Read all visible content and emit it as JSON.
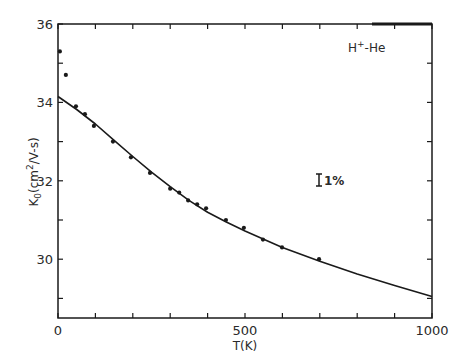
{
  "chart_data": {
    "type": "scatter",
    "title": "",
    "xlabel": "T(K)",
    "ylabel": "K₀(cm²/V-s)",
    "ylabel_parts": {
      "main": "K",
      "sub": "0",
      "rest": "(cm",
      "sup": "2",
      "tail": "/V-s)"
    },
    "xlim": [
      0,
      1000
    ],
    "ylim": [
      28.5,
      36
    ],
    "x_ticks": [
      0,
      100,
      200,
      300,
      400,
      500,
      600,
      700,
      800,
      900,
      1000
    ],
    "x_tick_labels": [
      {
        "value": 0,
        "label": "0"
      },
      {
        "value": 500,
        "label": "500"
      },
      {
        "value": 1000,
        "label": "1000"
      }
    ],
    "y_ticks": [
      29,
      30,
      31,
      32,
      33,
      34,
      35,
      36
    ],
    "y_tick_labels": [
      {
        "value": 30,
        "label": "30"
      },
      {
        "value": 32,
        "label": "32"
      },
      {
        "value": 34,
        "label": "34"
      },
      {
        "value": 36,
        "label": "36"
      }
    ],
    "grid": false,
    "legend": null,
    "series": [
      {
        "name": "measured",
        "kind": "scatter",
        "color": "#1a1a1a",
        "x": [
          5,
          21,
          48,
          72,
          96,
          147,
          195,
          246,
          300,
          324,
          348,
          372,
          396,
          449,
          497,
          548,
          599,
          698
        ],
        "y": [
          35.3,
          34.7,
          33.9,
          33.7,
          33.4,
          33.0,
          32.6,
          32.2,
          31.8,
          31.7,
          31.5,
          31.4,
          31.3,
          31.0,
          30.8,
          30.5,
          30.3,
          30.0
        ]
      },
      {
        "name": "theory",
        "kind": "line",
        "color": "#1a1a1a",
        "x": [
          0,
          50,
          100,
          150,
          200,
          250,
          300,
          350,
          400,
          450,
          500,
          600,
          700,
          800,
          900,
          1000
        ],
        "y": [
          34.15,
          33.82,
          33.45,
          33.03,
          32.62,
          32.22,
          31.85,
          31.5,
          31.2,
          30.95,
          30.72,
          30.3,
          29.95,
          29.62,
          29.33,
          29.05
        ]
      }
    ],
    "annotations": [
      {
        "text_main": "H",
        "text_sup": "+",
        "text_tail": "-He",
        "x": 870,
        "y": 35.5
      },
      {
        "text": "1%",
        "error_bar_label": true,
        "x": 790,
        "y": 31.65
      }
    ]
  },
  "labels": {
    "x_axis_title": "T(K)",
    "species": {
      "main": "H",
      "sup": "+",
      "tail": "-He"
    },
    "error_bar_text": "1%"
  }
}
